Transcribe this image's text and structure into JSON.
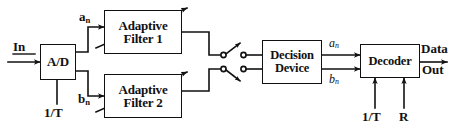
{
  "diagram": {
    "stroke_color": "#111111",
    "background_color": "#ffffff"
  },
  "blocks": {
    "adc": {
      "label": "A/D"
    },
    "filter1": {
      "line1": "Adaptive",
      "line2": "Filter 1"
    },
    "filter2": {
      "line1": "Adaptive",
      "line2": "Filter 2"
    },
    "decision": {
      "line1": "Decision",
      "line2": "Device"
    },
    "decoder": {
      "label": "Decoder"
    }
  },
  "labels": {
    "input": "In",
    "adc_clock": "1/T",
    "a_n_in_base": "a",
    "a_n_in_sub": "n",
    "b_n_in_base": "b",
    "b_n_in_sub": "n",
    "a_n_out_base": "a",
    "a_n_out_sub": "n",
    "b_n_out_base": "b",
    "b_n_out_sub": "n",
    "decoder_clock": "1/T",
    "decoder_rate": "R",
    "output_line1": "Data",
    "output_line2": "Out"
  },
  "icons": {
    "switch_top": "switch-contact-icon",
    "switch_bottom": "switch-contact-icon",
    "adapt_arrow_1": "adaptation-arrow-icon",
    "adapt_arrow_2": "adaptation-arrow-icon"
  }
}
